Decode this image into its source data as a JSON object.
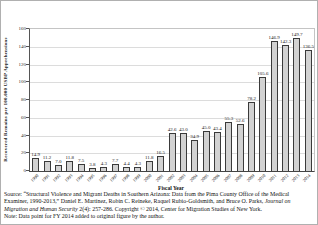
{
  "figure": {
    "y_axis_title": "Recovered Remains per 100,000 USBP Apprehensions",
    "x_axis_title": "Fiscal Year",
    "source_text_before_italic": "Source: “Structural Violence and Migrant Deaths in Southern Arizona: Data from the Pima County Office of the Medical Examiner, 1990-2013,” Daniel E. Martínez, Robin C. Reineke, Raquel Rubio-Goldsmith, and Bruce O. Parks, ",
    "source_text_italic": "Journal on Migration and Human Security",
    "source_text_after_italic": " 2(4): 257-286. Copyright © 2014, Center for Migration Studies of New York.",
    "note_text": "Note: Data point for FY 2014 added to original figure by the author.",
    "colors": {
      "bar_fill": "#d2d2d2",
      "bar_border": "#3a3a3a",
      "gridline": "#dcdcdc",
      "axis_line": "#444444",
      "text": "#222222",
      "background": "#ffffff"
    }
  },
  "chart_data": {
    "type": "bar",
    "title": "",
    "xlabel": "Fiscal Year",
    "ylabel": "Recovered Remains per 100,000 USBP Apprehensions",
    "categories": [
      "1990",
      "1991",
      "1992",
      "1993",
      "1994",
      "1995",
      "1996",
      "1997",
      "1998",
      "1999",
      "2000",
      "2001",
      "2002",
      "2003",
      "2004",
      "2005",
      "2006",
      "2007",
      "2008",
      "2009",
      "2010",
      "2011",
      "2012",
      "2013",
      "2014"
    ],
    "values": [
      14.9,
      11.2,
      7.0,
      11.8,
      7.5,
      3.8,
      4.3,
      7.7,
      4.4,
      4.3,
      11.8,
      16.5,
      42.6,
      43.0,
      34.9,
      45.0,
      43.4,
      55.3,
      52.6,
      78.2,
      105.6,
      146.9,
      142.3,
      149.7,
      136.5
    ],
    "ylim": [
      0,
      160
    ],
    "ytick_step": 20,
    "yticks": [
      0,
      20,
      40,
      60,
      80,
      100,
      120,
      140,
      160
    ],
    "grid": true,
    "legend": false,
    "value_labels_shown": true
  }
}
